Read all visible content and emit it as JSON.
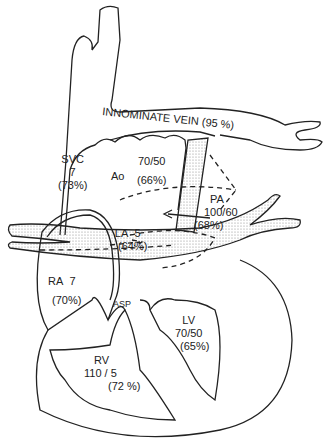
{
  "diagram": {
    "type": "heart-anatomy-pressures-saturations",
    "colors": {
      "line": "#222222",
      "stipple": "#cfcfcf",
      "background": "#ffffff"
    },
    "labels": {
      "innominate": {
        "name": "INNOMINATE  VEIN",
        "sat": "(95 %)"
      },
      "svc": {
        "name": "SVC",
        "pressure": "7",
        "sat": "(73%)"
      },
      "ao": {
        "name": "Ao",
        "pressure": "70/50",
        "sat": "(66%)"
      },
      "pa": {
        "name": "PA",
        "pressure": "100/60",
        "sat": "(68%)"
      },
      "la": {
        "name": "LA",
        "pressure": "5",
        "sat": "(64%)"
      },
      "ra": {
        "name": "RA",
        "pressure": "7",
        "sat": "(70%)"
      },
      "asp": {
        "name": "ASP"
      },
      "lv": {
        "name": "LV",
        "pressure": "70/50",
        "sat": "(65%)"
      },
      "rv": {
        "name": "RV",
        "pressure": "110 / 5",
        "sat": "(72 %)"
      }
    }
  }
}
